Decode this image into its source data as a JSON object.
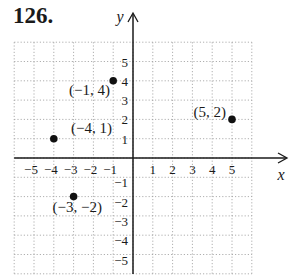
{
  "problem_number": "126.",
  "chart_data": {
    "type": "scatter",
    "title": "",
    "xlabel": "x",
    "ylabel": "y",
    "xlim": [
      -6,
      6
    ],
    "ylim": [
      -6,
      6
    ],
    "x_ticks": [
      -5,
      -4,
      -3,
      -2,
      -1,
      1,
      2,
      3,
      4,
      5
    ],
    "y_ticks": [
      -5,
      -4,
      -3,
      -2,
      -1,
      1,
      2,
      3,
      4,
      5
    ],
    "grid": true,
    "points": [
      {
        "x": -1,
        "y": 4,
        "label": "(−1, 4)"
      },
      {
        "x": -4,
        "y": 1,
        "label": "(−4, 1)"
      },
      {
        "x": 5,
        "y": 2,
        "label": "(5, 2)"
      },
      {
        "x": -3,
        "y": -2,
        "label": "(−3, −2)"
      }
    ]
  },
  "colors": {
    "axis": "#1a1a1a",
    "grid": "#9a9a9a",
    "point": "#111111"
  }
}
